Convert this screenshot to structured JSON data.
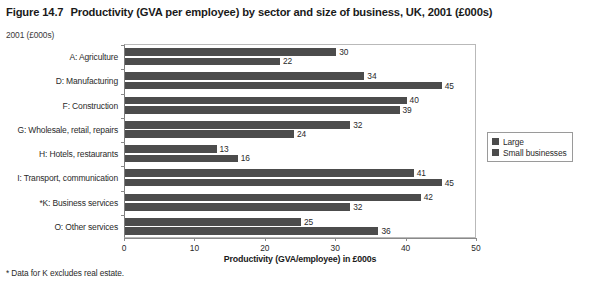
{
  "title": {
    "figure_number": "Figure 14.7",
    "text": "Productivity (GVA per employee) by sector and size of business, UK, 2001 (£000s)"
  },
  "subtitle": "2001 (£000s)",
  "footnote": "* Data for K excludes real estate.",
  "legend": {
    "position": "right",
    "items": [
      {
        "label": "Large",
        "color": "#4c4c4c"
      },
      {
        "label": "Small businesses",
        "color": "#4c4c4c"
      }
    ]
  },
  "chart_data": {
    "type": "bar",
    "orientation": "horizontal",
    "title": "Productivity (GVA per employee) by sector and size of business, UK, 2001 (£000s)",
    "subtitle": "2001 (£000s)",
    "xlabel": "Productivity (GVA/employee) in £000s",
    "ylabel": "",
    "xlim": [
      0,
      50
    ],
    "xticks": [
      0,
      10,
      20,
      30,
      40,
      50
    ],
    "xtick_labels": [
      "0",
      "10",
      "20",
      "30",
      "40",
      "50"
    ],
    "grid": false,
    "legend_position": "right",
    "categories": [
      "A: Agriculture",
      "D: Manufacturing",
      "F: Construction",
      "G: Wholesale, retail, repairs",
      "H: Hotels, restaurants",
      "I: Transport, communication",
      "*K: Business services",
      "O: Other services"
    ],
    "series": [
      {
        "name": "Large",
        "color": "#4c4c4c",
        "values": [
          30,
          34,
          40,
          32,
          13,
          41,
          42,
          25
        ]
      },
      {
        "name": "Small businesses",
        "color": "#4c4c4c",
        "values": [
          22,
          45,
          39,
          24,
          16,
          45,
          32,
          36
        ]
      }
    ],
    "annotations": [
      "* Data for K excludes real estate."
    ]
  }
}
